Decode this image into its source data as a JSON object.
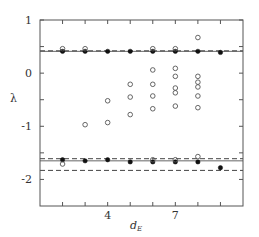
{
  "chart_data": {
    "type": "scatter",
    "title": "",
    "xlabel": "d_E",
    "ylabel": "λ",
    "xlim": [
      1,
      10
    ],
    "ylim": [
      -2.5,
      1
    ],
    "x_ticks": [
      2,
      3,
      4,
      5,
      6,
      7,
      8,
      9
    ],
    "x_tick_labels": {
      "4": "4",
      "7": "7"
    },
    "y_ticks": [
      1,
      0.5,
      0,
      -0.5,
      -1,
      -1.5,
      -2
    ],
    "y_tick_labels": {
      "1": "1",
      "0": "0",
      "-1": "-1",
      "-2": "-2"
    },
    "grid": false,
    "legend": null,
    "series": [
      {
        "name": "filled (true exponents)",
        "marker": "filled-circle",
        "points": [
          [
            2,
            0.41
          ],
          [
            3,
            0.41
          ],
          [
            4,
            0.41
          ],
          [
            5,
            0.41
          ],
          [
            6,
            0.41
          ],
          [
            7,
            0.41
          ],
          [
            8,
            0.41
          ],
          [
            9,
            0.39
          ],
          [
            2,
            -1.63
          ],
          [
            3,
            -1.65
          ],
          [
            4,
            -1.63
          ],
          [
            5,
            -1.67
          ],
          [
            6,
            -1.67
          ],
          [
            7,
            -1.67
          ],
          [
            8,
            -1.67
          ],
          [
            9,
            -1.78
          ]
        ]
      },
      {
        "name": "open (spurious exponents)",
        "marker": "open-circle",
        "points": [
          [
            2,
            0.46
          ],
          [
            3,
            0.46
          ],
          [
            6,
            0.46
          ],
          [
            7,
            0.46
          ],
          [
            8,
            0.67
          ],
          [
            3,
            -0.97
          ],
          [
            4,
            -0.52
          ],
          [
            4,
            -0.93
          ],
          [
            5,
            -0.21
          ],
          [
            5,
            -0.45
          ],
          [
            5,
            -0.78
          ],
          [
            6,
            0.06
          ],
          [
            6,
            -0.21
          ],
          [
            6,
            -0.43
          ],
          [
            6,
            -0.67
          ],
          [
            7,
            0.09
          ],
          [
            7,
            -0.06
          ],
          [
            7,
            -0.28
          ],
          [
            7,
            -0.37
          ],
          [
            7,
            -0.62
          ],
          [
            8,
            -0.06
          ],
          [
            8,
            -0.17
          ],
          [
            8,
            -0.26
          ],
          [
            8,
            -0.43
          ],
          [
            8,
            -0.65
          ],
          [
            2,
            -1.71
          ],
          [
            6,
            -1.63
          ],
          [
            7,
            -1.63
          ],
          [
            8,
            -1.57
          ]
        ]
      }
    ],
    "reference_lines": [
      {
        "style": "solid",
        "y": 0.41
      },
      {
        "style": "dashed",
        "y": 0.42
      },
      {
        "style": "solid",
        "y": -1.65
      },
      {
        "style": "dashed",
        "y": -1.61
      },
      {
        "style": "dashed",
        "y": -1.83
      }
    ]
  }
}
